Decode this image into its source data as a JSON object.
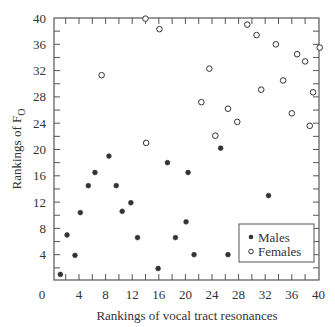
{
  "chart_data": {
    "type": "scatter",
    "title": "",
    "xlabel": "Rankings of vocal tract resonances",
    "ylabel": "Rankings of F",
    "ylabel_subscript": "O",
    "xlim": [
      0,
      40
    ],
    "ylim": [
      0,
      40
    ],
    "xticks": [
      0,
      4,
      8,
      12,
      16,
      20,
      24,
      28,
      32,
      36,
      40
    ],
    "yticks": [
      4,
      8,
      12,
      16,
      20,
      24,
      28,
      32,
      36,
      40
    ],
    "minor_tick_step": 2,
    "grid": false,
    "legend_position": "lower right",
    "series": [
      {
        "name": "Males",
        "marker": "filled-circle",
        "points": [
          [
            1.2,
            1.0
          ],
          [
            2.2,
            7.0
          ],
          [
            3.4,
            3.9
          ],
          [
            4.2,
            10.4
          ],
          [
            5.4,
            14.5
          ],
          [
            6.4,
            16.5
          ],
          [
            8.5,
            19.0
          ],
          [
            9.6,
            14.5
          ],
          [
            10.5,
            10.6
          ],
          [
            11.8,
            11.9
          ],
          [
            12.8,
            6.6
          ],
          [
            15.9,
            1.9
          ],
          [
            17.3,
            18.0
          ],
          [
            18.5,
            6.6
          ],
          [
            20.1,
            9.0
          ],
          [
            20.4,
            16.5
          ],
          [
            21.3,
            4.0
          ],
          [
            25.3,
            20.2
          ],
          [
            26.4,
            4.0
          ],
          [
            32.5,
            13.0
          ]
        ]
      },
      {
        "name": "Females",
        "marker": "open-circle",
        "points": [
          [
            7.4,
            31.3
          ],
          [
            14.0,
            39.9
          ],
          [
            14.1,
            21.0
          ],
          [
            16.1,
            38.3
          ],
          [
            22.4,
            27.2
          ],
          [
            23.6,
            32.3
          ],
          [
            24.5,
            22.1
          ],
          [
            26.4,
            26.2
          ],
          [
            27.8,
            24.2
          ],
          [
            29.3,
            39.0
          ],
          [
            30.7,
            37.4
          ],
          [
            31.4,
            29.1
          ],
          [
            33.6,
            36.0
          ],
          [
            34.7,
            30.5
          ],
          [
            36.0,
            25.5
          ],
          [
            36.8,
            34.5
          ],
          [
            38.0,
            33.4
          ],
          [
            38.7,
            23.6
          ],
          [
            39.2,
            28.7
          ],
          [
            40.2,
            35.5
          ]
        ]
      }
    ]
  },
  "legend": {
    "items": [
      {
        "label": "Males",
        "marker": "filled-circle"
      },
      {
        "label": "Females",
        "marker": "open-circle"
      }
    ]
  },
  "colors": {
    "ink": "#333333",
    "frame": "#555555",
    "background": "#ffffff"
  }
}
